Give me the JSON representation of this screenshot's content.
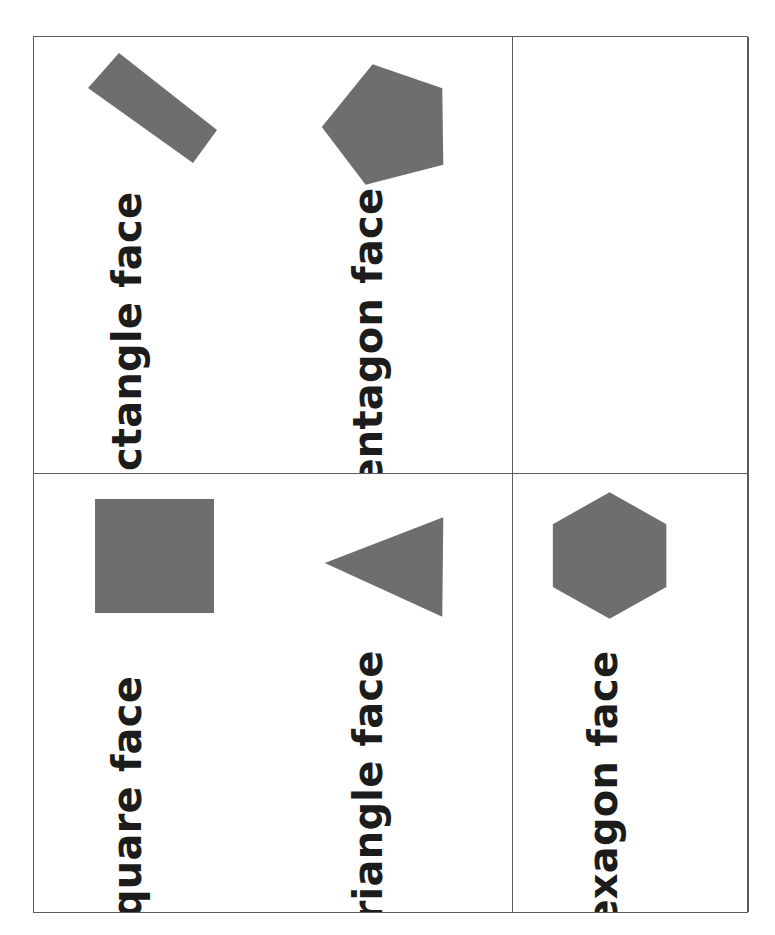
{
  "worksheet": {
    "title": "shape face flashcards",
    "background_color": "#ffffff",
    "border_color": "#5c5c5c",
    "shape_fill_color": "#6e6e6e",
    "text_color": "#1c1c1c",
    "columns": 3,
    "rows": 2,
    "text_orientation": "rotated 90 degrees counter-clockwise"
  },
  "cells": [
    {
      "position": "row1-col1",
      "label": "rectangle face",
      "shape": "rectangle",
      "shape_name": "rectangle-shape",
      "rotation_deg": 38,
      "empty": false
    },
    {
      "position": "row1-col2",
      "label": "pentagon face",
      "shape": "pentagon",
      "shape_name": "pentagon-shape",
      "rotation_deg": 18,
      "empty": false
    },
    {
      "position": "row1-col3",
      "label": "",
      "shape": "",
      "shape_name": "empty-cell",
      "rotation_deg": 0,
      "empty": true
    },
    {
      "position": "row2-col1",
      "label": "square face",
      "shape": "square",
      "shape_name": "square-shape",
      "rotation_deg": 0,
      "empty": false
    },
    {
      "position": "row2-col2",
      "label": "triangle face",
      "shape": "triangle",
      "shape_name": "triangle-shape",
      "rotation_deg": 0,
      "empty": false
    },
    {
      "position": "row2-col3",
      "label": "hexagon face",
      "shape": "hexagon",
      "shape_name": "hexagon-shape",
      "rotation_deg": 0,
      "empty": false
    }
  ]
}
